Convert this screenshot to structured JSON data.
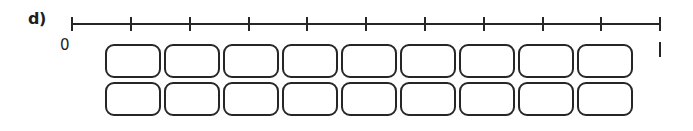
{
  "figure": {
    "part_label": "d)",
    "origin_label": "0",
    "line_color": "#262626",
    "box_border_color": "#262626",
    "box_fill_color": "#ffffff",
    "background_color": "#ffffff"
  },
  "number_line": {
    "start_x": 72,
    "end_x": 660,
    "y": 24,
    "tick_count": 11,
    "interval_count": 10,
    "tick_positions": [
      72,
      131,
      190,
      249,
      307,
      366,
      425,
      484,
      543,
      601,
      660
    ],
    "tick_height": 14,
    "line_thickness": 2,
    "end_mark_label": ""
  },
  "boxes": {
    "rows": 2,
    "columns": 9,
    "box_width": 56,
    "box_height": 34,
    "gap": 3,
    "corner_radius": 9,
    "row_labels": [
      "row-1",
      "row-2"
    ],
    "cells": [
      [
        "",
        "",
        "",
        "",
        "",
        "",
        "",
        "",
        ""
      ],
      [
        "",
        "",
        "",
        "",
        "",
        "",
        "",
        "",
        ""
      ]
    ]
  },
  "chart_data": {
    "type": "diagram",
    "title": "",
    "series": [
      {
        "name": "number-line-ticks",
        "values": [
          0,
          1,
          2,
          3,
          4,
          5,
          6,
          7,
          8,
          9,
          10
        ]
      },
      {
        "name": "boxes-row-1",
        "values": [
          1,
          1,
          1,
          1,
          1,
          1,
          1,
          1,
          1
        ]
      },
      {
        "name": "boxes-row-2",
        "values": [
          1,
          1,
          1,
          1,
          1,
          1,
          1,
          1,
          1
        ]
      }
    ],
    "xlabel": "",
    "ylabel": "",
    "grid": false,
    "legend": "none"
  }
}
